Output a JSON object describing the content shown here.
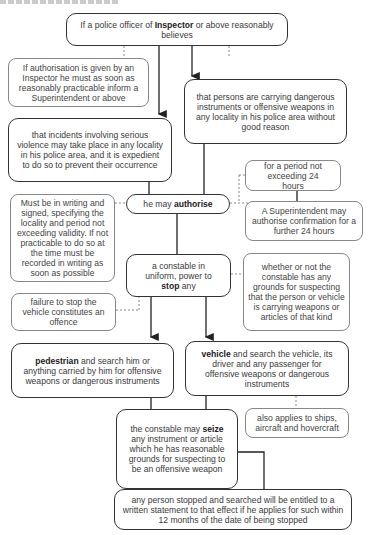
{
  "header": {
    "cropped_text": "…"
  },
  "nodes": {
    "believes": {
      "pre": "If a police officer of ",
      "bold": "Inspector",
      "post": " or above reasonably believes"
    },
    "inform_superintendent": {
      "text": "If authorisation is given by an Inspector he must as soon as reasonably practicable inform a Superintendent or above"
    },
    "persons_carrying": {
      "text": "that persons are carrying dangerous instruments or offensive weapons in any locality in his police area without good reason"
    },
    "serious_violence": {
      "text": "that incidents involving serious violence may take place in any locality in his police area, and it is expedient to do so to prevent their occurrence"
    },
    "period": {
      "text": "for a period not exceeding 24 hours"
    },
    "authorise": {
      "pre": "he may ",
      "bold": "authorise"
    },
    "superintendent_confirm": {
      "text": "A Superintendent may authorise confirmation for a further 24 hours"
    },
    "writing": {
      "text": "Must be in writing and signed, specifying the locality and period not exceeding validity. If not practicable to do so at the time must be recorded in writing as soon as possible"
    },
    "constable_stop": {
      "pre": "a constable in uniform, power to ",
      "bold": "stop",
      "post": " any"
    },
    "grounds": {
      "text": "whether or not the constable has any grounds for suspecting that the person or vehicle is carrying weapons or articles of that kind"
    },
    "failure_offence": {
      "text": "failure to stop the vehicle constitutes an offence"
    },
    "pedestrian": {
      "bold": "pedestrian",
      "post": " and search him or anything carried by him for offensive weapons or dangerous instruments"
    },
    "vehicle": {
      "bold": "vehicle",
      "post": " and search the vehicle, its driver and any passenger for offensive weapons or dangerous instruments"
    },
    "seize": {
      "pre": "the constable may ",
      "bold": "seize",
      "post": " any instrument or article which he has reasonable grounds for suspecting to be an offensive weapon"
    },
    "ships": {
      "text": "also applies to ships, aircraft and hovercraft"
    },
    "written_statement": {
      "text": "any person stopped and searched will be entitled to a written statement to that effect if he applies for such within 12 months of the date of being stopped"
    }
  },
  "colors": {
    "line": "#333333",
    "dashed": "#888888",
    "text": "#3a3a3a"
  }
}
